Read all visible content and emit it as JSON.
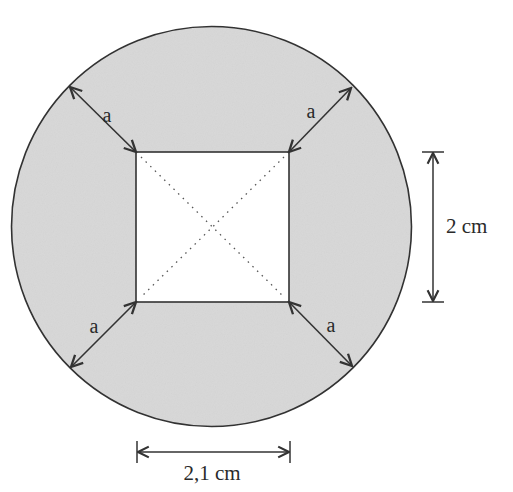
{
  "diagram": {
    "type": "geometry",
    "colors": {
      "circle_fill": "#d9d9d9",
      "stroke": "#333333",
      "square_fill": "#ffffff",
      "dotted": "#555555"
    },
    "circle": {
      "cx": 211.5,
      "cy": 226.5,
      "r": 200
    },
    "square": {
      "x": 136,
      "y": 152,
      "width": 153,
      "height": 150
    },
    "corner_gap_label": "a",
    "corner_arrows": [
      {
        "label": "a",
        "position": "top-left",
        "from": [
          136,
          152
        ],
        "to": [
          70,
          87
        ],
        "label_pos": [
          97,
          123
        ]
      },
      {
        "label": "a",
        "position": "top-right",
        "from": [
          289,
          152
        ],
        "to": [
          351,
          88
        ],
        "label_pos": [
          309,
          118
        ]
      },
      {
        "label": "a",
        "position": "bottom-left",
        "from": [
          136,
          302
        ],
        "to": [
          71,
          367
        ],
        "label_pos": [
          94,
          333
        ]
      },
      {
        "label": "a",
        "position": "bottom-right",
        "from": [
          289,
          302
        ],
        "to": [
          352,
          366
        ],
        "label_pos": [
          330,
          332
        ]
      }
    ],
    "dimensions": {
      "height": {
        "label": "2 cm",
        "x": 432,
        "y1": 152,
        "y2": 302,
        "label_pos": [
          446,
          232
        ]
      },
      "width": {
        "label": "2,1 cm",
        "y": 452,
        "x1": 136,
        "x2": 290,
        "label_pos": [
          212,
          479
        ]
      }
    }
  }
}
